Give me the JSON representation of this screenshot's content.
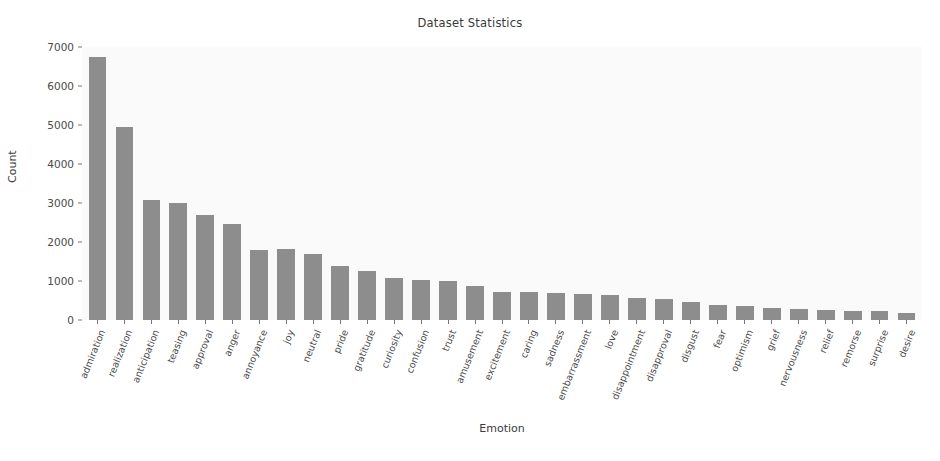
{
  "chart_data": {
    "type": "bar",
    "title": "Dataset Statistics",
    "xlabel": "Emotion",
    "ylabel": "Count",
    "ylim": [
      0,
      7000
    ],
    "ytick_labels": [
      "0",
      "1000",
      "2000",
      "3000",
      "4000",
      "5000",
      "6000",
      "7000"
    ],
    "ytick_values": [
      0,
      1000,
      2000,
      3000,
      4000,
      5000,
      6000,
      7000
    ],
    "grid": false,
    "legend": "none",
    "bar_color": "#8d8d8d",
    "plot_background": "#fafafa",
    "categories": [
      "admiration",
      "realization",
      "anticipation",
      "teasing",
      "approval",
      "anger",
      "annoyance",
      "joy",
      "neutral",
      "pride",
      "gratitude",
      "curiosity",
      "confusion",
      "trust",
      "amusement",
      "excitement",
      "caring",
      "sadness",
      "embarrassment",
      "love",
      "disappointment",
      "disapproval",
      "disgust",
      "fear",
      "optimism",
      "grief",
      "nervousness",
      "relief",
      "remorse",
      "surprise",
      "desire"
    ],
    "values": [
      6750,
      4950,
      3080,
      3000,
      2680,
      2460,
      1800,
      1810,
      1690,
      1380,
      1250,
      1090,
      1020,
      1000,
      880,
      730,
      710,
      680,
      670,
      640,
      570,
      540,
      450,
      390,
      350,
      300,
      290,
      260,
      240,
      230,
      180
    ]
  }
}
